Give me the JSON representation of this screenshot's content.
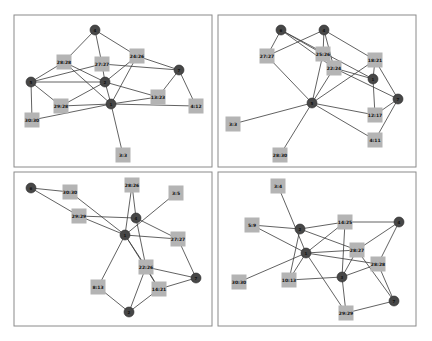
{
  "style": {
    "node_color": "#474747",
    "box_color": "#b4b4b4",
    "edge_color": "#3a3a3a",
    "frame_color": "#8a8a8a",
    "node_radius": 5,
    "box_size": 15
  },
  "panels": [
    {
      "id": "top-left",
      "frame": [
        14,
        15,
        198,
        152
      ],
      "nodes": [
        {
          "id": "n4",
          "label": "4",
          "x": 95,
          "y": 30
        },
        {
          "id": "n5",
          "label": "5",
          "x": 31,
          "y": 82
        },
        {
          "id": "n2",
          "label": "2",
          "x": 105,
          "y": 82
        },
        {
          "id": "n1",
          "label": "1",
          "x": 111,
          "y": 104
        },
        {
          "id": "n7",
          "label": "7",
          "x": 179,
          "y": 70
        }
      ],
      "boxes": [
        {
          "id": "b28_28",
          "label": "28:28",
          "x": 64,
          "y": 62
        },
        {
          "id": "b27_27",
          "label": "27:27",
          "x": 102,
          "y": 64
        },
        {
          "id": "b24_26",
          "label": "24:26",
          "x": 137,
          "y": 56
        },
        {
          "id": "b13_23",
          "label": "13:23",
          "x": 158,
          "y": 97
        },
        {
          "id": "b4_12",
          "label": "4:12",
          "x": 196,
          "y": 106
        },
        {
          "id": "b29_28",
          "label": "29:28",
          "x": 61,
          "y": 106
        },
        {
          "id": "b30_30",
          "label": "30:30",
          "x": 32,
          "y": 120
        },
        {
          "id": "b3_3",
          "label": "3:3",
          "x": 123,
          "y": 155
        }
      ],
      "edges": [
        [
          "n4",
          "b28_28"
        ],
        [
          "n4",
          "b27_27"
        ],
        [
          "n4",
          "b24_26"
        ],
        [
          "b28_28",
          "n5"
        ],
        [
          "b28_28",
          "n2"
        ],
        [
          "b28_28",
          "n1"
        ],
        [
          "n5",
          "b27_27"
        ],
        [
          "n5",
          "n2"
        ],
        [
          "n5",
          "b29_28"
        ],
        [
          "n5",
          "b30_30"
        ],
        [
          "b27_27",
          "n2"
        ],
        [
          "b27_27",
          "n7"
        ],
        [
          "b24_26",
          "n2"
        ],
        [
          "b24_26",
          "n1"
        ],
        [
          "b24_26",
          "n7"
        ],
        [
          "n2",
          "n1"
        ],
        [
          "n2",
          "b13_23"
        ],
        [
          "n2",
          "b29_28"
        ],
        [
          "n1",
          "b29_28"
        ],
        [
          "n1",
          "b30_30"
        ],
        [
          "n1",
          "b13_23"
        ],
        [
          "n1",
          "b4_12"
        ],
        [
          "n1",
          "b3_3"
        ],
        [
          "n7",
          "b13_23"
        ],
        [
          "n7",
          "b4_12"
        ]
      ]
    },
    {
      "id": "top-right",
      "frame": [
        218,
        15,
        198,
        152
      ],
      "nodes": [
        {
          "id": "n6",
          "label": "6",
          "x": 281,
          "y": 30
        },
        {
          "id": "n4",
          "label": "4",
          "x": 324,
          "y": 30
        },
        {
          "id": "n5",
          "label": "5",
          "x": 312,
          "y": 103
        },
        {
          "id": "n1",
          "label": "1",
          "x": 373,
          "y": 79
        },
        {
          "id": "n7",
          "label": "7",
          "x": 398,
          "y": 99
        }
      ],
      "boxes": [
        {
          "id": "b27_27",
          "label": "27:27",
          "x": 267,
          "y": 56
        },
        {
          "id": "b25_26",
          "label": "25:26",
          "x": 323,
          "y": 54
        },
        {
          "id": "b22_24",
          "label": "22:24",
          "x": 334,
          "y": 68
        },
        {
          "id": "b18_21",
          "label": "18:21",
          "x": 375,
          "y": 60
        },
        {
          "id": "b12_17",
          "label": "12:17",
          "x": 375,
          "y": 115
        },
        {
          "id": "b4_11",
          "label": "4:11",
          "x": 375,
          "y": 140
        },
        {
          "id": "b3_3",
          "label": "3:3",
          "x": 233,
          "y": 124
        },
        {
          "id": "b28_30",
          "label": "28:30",
          "x": 280,
          "y": 155
        }
      ],
      "edges": [
        [
          "n6",
          "b27_27"
        ],
        [
          "n6",
          "b25_26"
        ],
        [
          "n6",
          "b22_24"
        ],
        [
          "n6",
          "n1"
        ],
        [
          "n4",
          "b27_27"
        ],
        [
          "n4",
          "b25_26"
        ],
        [
          "n4",
          "b22_24"
        ],
        [
          "n4",
          "b18_21"
        ],
        [
          "b27_27",
          "n5"
        ],
        [
          "b25_26",
          "n5"
        ],
        [
          "b22_24",
          "n5"
        ],
        [
          "b22_24",
          "n1"
        ],
        [
          "b22_24",
          "n7"
        ],
        [
          "b18_21",
          "n5"
        ],
        [
          "b18_21",
          "n1"
        ],
        [
          "b18_21",
          "n7"
        ],
        [
          "n1",
          "b12_17"
        ],
        [
          "n5",
          "b12_17"
        ],
        [
          "n5",
          "b4_11"
        ],
        [
          "n5",
          "b3_3"
        ],
        [
          "n5",
          "b28_30"
        ],
        [
          "n7",
          "b12_17"
        ],
        [
          "n7",
          "b4_11"
        ]
      ]
    },
    {
      "id": "bottom-left",
      "frame": [
        14,
        172,
        198,
        154
      ],
      "nodes": [
        {
          "id": "n6",
          "label": "6",
          "x": 31,
          "y": 188
        },
        {
          "id": "n4",
          "label": "4",
          "x": 136,
          "y": 218
        },
        {
          "id": "n1",
          "label": "1",
          "x": 125,
          "y": 235
        },
        {
          "id": "n7",
          "label": "7",
          "x": 196,
          "y": 278
        },
        {
          "id": "n2",
          "label": "2",
          "x": 129,
          "y": 312
        }
      ],
      "boxes": [
        {
          "id": "b30_30",
          "label": "30:30",
          "x": 70,
          "y": 192
        },
        {
          "id": "b29_29",
          "label": "29:29",
          "x": 79,
          "y": 216
        },
        {
          "id": "b28_26",
          "label": "28:26",
          "x": 132,
          "y": 185
        },
        {
          "id": "b3_5",
          "label": "3:5",
          "x": 176,
          "y": 193
        },
        {
          "id": "b27_27",
          "label": "27:27",
          "x": 178,
          "y": 239
        },
        {
          "id": "b22_26",
          "label": "22:26",
          "x": 146,
          "y": 267
        },
        {
          "id": "b8_13",
          "label": "8:13",
          "x": 98,
          "y": 287
        },
        {
          "id": "b14_21",
          "label": "14:21",
          "x": 159,
          "y": 289
        }
      ],
      "edges": [
        [
          "n6",
          "b30_30"
        ],
        [
          "n6",
          "b29_29"
        ],
        [
          "b30_30",
          "n1"
        ],
        [
          "b29_29",
          "n4"
        ],
        [
          "b29_29",
          "n1"
        ],
        [
          "b28_26",
          "n4"
        ],
        [
          "b28_26",
          "n1"
        ],
        [
          "b3_5",
          "n1"
        ],
        [
          "n4",
          "b27_27"
        ],
        [
          "n4",
          "b22_26"
        ],
        [
          "n1",
          "b27_27"
        ],
        [
          "n1",
          "b22_26"
        ],
        [
          "n1",
          "b8_13"
        ],
        [
          "n1",
          "b14_21"
        ],
        [
          "b27_27",
          "n7"
        ],
        [
          "b22_26",
          "n7"
        ],
        [
          "b22_26",
          "n2"
        ],
        [
          "b22_26",
          "b14_21"
        ],
        [
          "b8_13",
          "n2"
        ],
        [
          "b14_21",
          "n2"
        ],
        [
          "b14_21",
          "n7"
        ]
      ]
    },
    {
      "id": "bottom-right",
      "frame": [
        218,
        172,
        198,
        154
      ],
      "nodes": [
        {
          "id": "n2",
          "label": "2",
          "x": 300,
          "y": 229
        },
        {
          "id": "n1",
          "label": "1",
          "x": 306,
          "y": 253
        },
        {
          "id": "n4",
          "label": "4",
          "x": 399,
          "y": 222
        },
        {
          "id": "n3",
          "label": "3",
          "x": 342,
          "y": 277
        },
        {
          "id": "n7",
          "label": "7",
          "x": 394,
          "y": 301
        }
      ],
      "boxes": [
        {
          "id": "b3_4",
          "label": "3:4",
          "x": 278,
          "y": 186
        },
        {
          "id": "b5_9",
          "label": "5:9",
          "x": 252,
          "y": 225
        },
        {
          "id": "b14_25",
          "label": "14:25",
          "x": 345,
          "y": 222
        },
        {
          "id": "b28_27",
          "label": "28:27",
          "x": 357,
          "y": 250
        },
        {
          "id": "b28_28",
          "label": "28:28",
          "x": 378,
          "y": 264
        },
        {
          "id": "b30_30",
          "label": "30:30",
          "x": 239,
          "y": 282
        },
        {
          "id": "b10_13",
          "label": "10:13",
          "x": 289,
          "y": 280
        },
        {
          "id": "b29_29",
          "label": "29:29",
          "x": 346,
          "y": 313
        }
      ],
      "edges": [
        [
          "b3_4",
          "n1"
        ],
        [
          "b5_9",
          "n2"
        ],
        [
          "b5_9",
          "n1"
        ],
        [
          "n2",
          "b14_25"
        ],
        [
          "n2",
          "b28_27"
        ],
        [
          "n2",
          "b10_13"
        ],
        [
          "n1",
          "b14_25"
        ],
        [
          "n1",
          "b28_27"
        ],
        [
          "n1",
          "b28_28"
        ],
        [
          "n1",
          "b30_30"
        ],
        [
          "n1",
          "b10_13"
        ],
        [
          "n1",
          "b29_29"
        ],
        [
          "b14_25",
          "n4"
        ],
        [
          "b14_25",
          "n3"
        ],
        [
          "n4",
          "b28_27"
        ],
        [
          "n4",
          "b28_28"
        ],
        [
          "b28_27",
          "n3"
        ],
        [
          "b28_27",
          "n7"
        ],
        [
          "b28_28",
          "n3"
        ],
        [
          "b28_28",
          "n7"
        ],
        [
          "b10_13",
          "n3"
        ],
        [
          "n3",
          "b29_29"
        ],
        [
          "b29_29",
          "n7"
        ]
      ]
    }
  ]
}
